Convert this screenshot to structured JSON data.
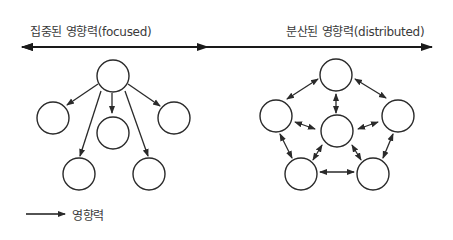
{
  "axis": {
    "left_label": "집중된 영향력(focused)",
    "right_label": "분산된 영향력(distributed)"
  },
  "legend": {
    "label": "영향력",
    "icon": "arrow-right-icon"
  },
  "diagrams": {
    "focused": {
      "nodes": [
        "top",
        "mid-left",
        "mid-center",
        "mid-right",
        "bottom-left",
        "bottom-right"
      ],
      "edges": [
        [
          "top",
          "mid-left"
        ],
        [
          "top",
          "mid-center"
        ],
        [
          "top",
          "mid-right"
        ],
        [
          "top",
          "bottom-left"
        ],
        [
          "top",
          "bottom-right"
        ]
      ],
      "edge_type": "one-way"
    },
    "distributed": {
      "nodes": [
        "top",
        "left",
        "center",
        "right",
        "bottom-left",
        "bottom-right"
      ],
      "edges": [
        [
          "top",
          "left"
        ],
        [
          "top",
          "right"
        ],
        [
          "top",
          "center"
        ],
        [
          "left",
          "center"
        ],
        [
          "right",
          "center"
        ],
        [
          "left",
          "bottom-left"
        ],
        [
          "right",
          "bottom-right"
        ],
        [
          "bottom-left",
          "bottom-right"
        ],
        [
          "center",
          "bottom-left"
        ],
        [
          "center",
          "bottom-right"
        ]
      ],
      "edge_type": "two-way"
    }
  },
  "colors": {
    "stroke": "#2a2a2a",
    "background": "#ffffff"
  }
}
